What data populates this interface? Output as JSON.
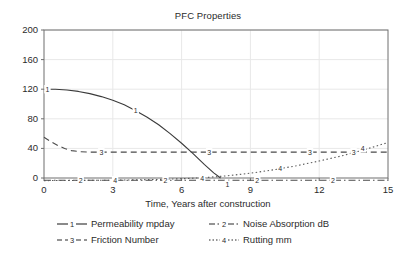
{
  "chart_data": {
    "type": "line",
    "title": "PFC Properties",
    "xlabel": "Time, Years after construction",
    "ylabel": "",
    "xlim": [
      0,
      15
    ],
    "ylim": [
      0,
      200
    ],
    "xticks": [
      0,
      3,
      6,
      9,
      12,
      15
    ],
    "yticks": [
      0,
      40,
      80,
      120,
      160,
      200
    ],
    "grid": true,
    "legend_position": "bottom",
    "series": [
      {
        "key": "1",
        "name": "Permeability mpday",
        "marker_label": "1",
        "linestyle": "solid",
        "color": "#3a3a3a",
        "x": [
          0,
          0.5,
          1,
          1.5,
          2,
          2.5,
          3,
          3.5,
          4,
          4.5,
          5,
          5.5,
          6,
          6.5,
          7,
          7.4,
          7.7
        ],
        "values": [
          120,
          120,
          119,
          117,
          114,
          110,
          105,
          99,
          91,
          82,
          72,
          60,
          47,
          33,
          18,
          7,
          0
        ],
        "inline_labels": [
          {
            "x": 0.15,
            "y": 120,
            "text": "1"
          },
          {
            "x": 4.0,
            "y": 91,
            "text": "1"
          },
          {
            "x": 8.0,
            "y": -9,
            "text": "1"
          }
        ]
      },
      {
        "key": "2",
        "name": "Noise Absorption dB",
        "marker_label": "2",
        "linestyle": "dashdot",
        "color": "#4a4a4a",
        "x": [
          0,
          15
        ],
        "values": [
          -3,
          -3
        ],
        "inline_labels": [
          {
            "x": 1.6,
            "y": -3,
            "text": "2"
          },
          {
            "x": 5.3,
            "y": -3,
            "text": "2"
          },
          {
            "x": 9.3,
            "y": -3,
            "text": "2"
          },
          {
            "x": 12.6,
            "y": -3,
            "text": "2"
          }
        ]
      },
      {
        "key": "3",
        "name": "Friction Number",
        "marker_label": "3",
        "linestyle": "dashed",
        "color": "#4a4a4a",
        "x": [
          0,
          0.3,
          0.6,
          0.9,
          1.2,
          1.6,
          2.0,
          2.5,
          3.0,
          15
        ],
        "values": [
          55,
          49,
          44,
          40,
          37,
          35.5,
          35,
          35,
          35,
          35
        ],
        "inline_labels": [
          {
            "x": 2.5,
            "y": 35,
            "text": "3"
          },
          {
            "x": 7.2,
            "y": 35,
            "text": "3"
          },
          {
            "x": 11.6,
            "y": 35,
            "text": "3"
          },
          {
            "x": 13.5,
            "y": 35,
            "text": "3"
          }
        ]
      },
      {
        "key": "4",
        "name": "Rutting mm",
        "marker_label": "4",
        "linestyle": "dotted",
        "color": "#5a5a5a",
        "x": [
          0,
          1,
          2,
          3,
          4,
          5,
          6,
          7,
          8,
          9,
          10,
          11,
          12,
          13,
          14,
          15
        ],
        "values": [
          -3.5,
          -3.4,
          -3.2,
          -2.9,
          -2.5,
          -1.9,
          -1.0,
          0.5,
          3,
          6.5,
          11,
          16.5,
          23,
          30,
          38.5,
          48
        ],
        "inline_labels": [
          {
            "x": 3.1,
            "y": -3,
            "text": "4"
          },
          {
            "x": 6.9,
            "y": -1,
            "text": "4"
          },
          {
            "x": 10.3,
            "y": 13,
            "text": "4"
          },
          {
            "x": 13.9,
            "y": 40,
            "text": "4"
          }
        ]
      }
    ]
  },
  "legend": {
    "rows": [
      [
        {
          "marker": "solid-with-number",
          "number": "1",
          "label": "Permeability mpday"
        },
        {
          "marker": "dashdot-with-number",
          "number": "2",
          "label": "Noise Absorption dB"
        }
      ],
      [
        {
          "marker": "dashed-with-number",
          "number": "3",
          "label": "Friction Number"
        },
        {
          "marker": "dotted-with-number",
          "number": "4",
          "label": "Rutting mm"
        }
      ]
    ]
  },
  "colors": {
    "axis": "#6e6e6e",
    "grid": "#e8e8e8",
    "text": "#2b2b2b",
    "background": "#ffffff"
  }
}
